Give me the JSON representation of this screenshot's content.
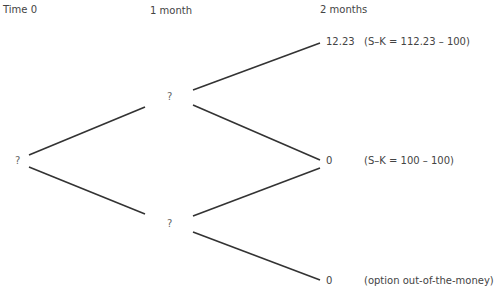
{
  "header": {
    "time0": "Time 0",
    "month1": "1 month",
    "month2": "2 months"
  },
  "tree": {
    "root": "?",
    "up": "?",
    "down": "?",
    "uu": {
      "value": "12.23",
      "note": "(S–K = 112.23 – 100)"
    },
    "ud": {
      "value": "0",
      "note": "(S–K = 100 – 100)"
    },
    "dd": {
      "value": "0",
      "note": "(option out-of-the-money)"
    }
  },
  "colors": {
    "line": "#333333",
    "text": "#555555"
  }
}
